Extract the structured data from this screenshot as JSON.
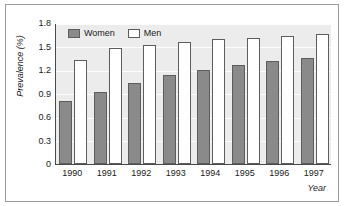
{
  "chart_data": {
    "type": "bar",
    "title": "",
    "subtitle": "",
    "xlabel": "Year",
    "ylabel": "Prevalence (%)",
    "categories": [
      "1990",
      "1991",
      "1992",
      "1993",
      "1994",
      "1995",
      "1996",
      "1997"
    ],
    "series": [
      {
        "name": "Women",
        "color": "#8a8a8a",
        "values": [
          0.81,
          0.92,
          1.04,
          1.14,
          1.2,
          1.26,
          1.32,
          1.35
        ]
      },
      {
        "name": "Men",
        "color": "#ffffff",
        "values": [
          1.33,
          1.48,
          1.52,
          1.56,
          1.59,
          1.61,
          1.64,
          1.66
        ]
      }
    ],
    "ylim": [
      0,
      1.8
    ],
    "yticks": [
      "0",
      "0.3",
      "0.6",
      "0.9",
      "1.2",
      "1.5",
      "1.8"
    ],
    "ytick_values": [
      0,
      0.3,
      0.6,
      0.9,
      1.2,
      1.5,
      1.8
    ],
    "grid": true,
    "grid_color": "#fdfdfd",
    "plot_background": "#ececec",
    "legend_position": "top-left",
    "axis_color": "#4a4a4a",
    "bar_border_color": "#5d5d5d",
    "frame_color": "#9a9a9a"
  },
  "legend": {
    "entries": [
      {
        "label": "Women"
      },
      {
        "label": "Men"
      }
    ]
  }
}
